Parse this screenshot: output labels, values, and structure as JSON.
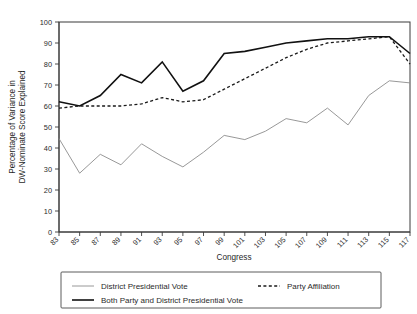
{
  "chart_data": {
    "type": "line",
    "title": "",
    "xlabel": "Congress",
    "ylabel": "Percentage of Variance in DW-Nominate Score Explained",
    "ylabel_line1": "Percentage of Variance in",
    "ylabel_line2": "DW-Nominate Score Explained",
    "categories": [
      "83",
      "85",
      "87",
      "89",
      "91",
      "93",
      "95",
      "97",
      "99",
      "101",
      "103",
      "105",
      "107",
      "109",
      "111",
      "113",
      "115",
      "117"
    ],
    "x": [
      83,
      85,
      87,
      89,
      91,
      93,
      95,
      97,
      99,
      101,
      103,
      105,
      107,
      109,
      111,
      113,
      115,
      117
    ],
    "xlim": [
      83,
      117
    ],
    "ylim": [
      0,
      100
    ],
    "yticks": [
      0,
      10,
      20,
      30,
      40,
      50,
      60,
      70,
      80,
      90,
      100
    ],
    "grid": false,
    "legend_position": "bottom",
    "series": [
      {
        "name": "District Presidential Vote",
        "style": "solid",
        "color": "#8c8c8c",
        "width": 0.9,
        "values": [
          44.5,
          28,
          37,
          32,
          42,
          36,
          31,
          38,
          46,
          44,
          48,
          54,
          52,
          59,
          51,
          65,
          72,
          71
        ]
      },
      {
        "name": "Party Affiliation",
        "style": "dashed",
        "color": "#1a1a1a",
        "width": 1.3,
        "values": [
          59,
          60,
          60,
          60,
          61,
          64,
          62,
          63,
          68,
          73,
          78,
          83,
          87,
          90,
          91,
          92,
          93,
          80
        ]
      },
      {
        "name": "Both Party and District Presidential Vote",
        "style": "solid",
        "color": "#111111",
        "width": 1.6,
        "values": [
          62,
          60,
          65,
          75,
          71,
          81,
          67,
          72,
          85,
          86,
          88,
          90,
          91,
          92,
          92,
          93,
          93,
          85
        ]
      }
    ],
    "legend": [
      {
        "name": "District Presidential Vote",
        "style": "solid",
        "color": "#8c8c8c",
        "width": 0.9
      },
      {
        "name": "Party Affiliation",
        "style": "dashed",
        "color": "#1a1a1a",
        "width": 1.3
      },
      {
        "name": "Both Party and District Presidential Vote",
        "style": "solid",
        "color": "#111111",
        "width": 1.6
      }
    ]
  }
}
